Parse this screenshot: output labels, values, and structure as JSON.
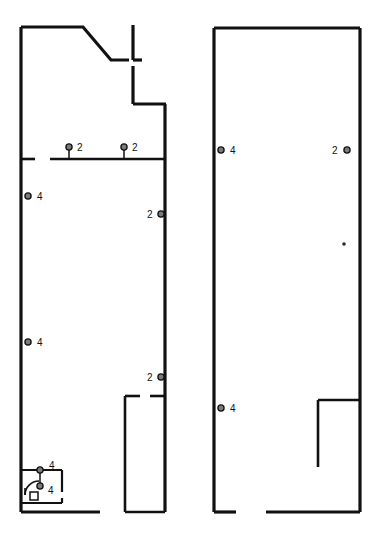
{
  "drawing": {
    "kind": "architectural-floor-plan",
    "title": "",
    "background_color": "#ffffff",
    "line_color": "#111111",
    "canvas": {
      "width": 372,
      "height": 546
    }
  },
  "units": [
    {
      "id": "left-unit",
      "name": "left-unit-outline",
      "description": "Left tenancy outline with chamfered top-right corner, stepped east wall and rear service room"
    },
    {
      "id": "right-unit",
      "name": "right-unit-outline",
      "description": "Right tenancy outline, rectangular with L-shaped rear partition"
    }
  ],
  "markers": [
    {
      "id": "m1",
      "label": "2",
      "unit": "left-unit",
      "element": "partition-wall",
      "style": "stem-up",
      "x": 69,
      "y": 158,
      "label_x": 77,
      "label_y": 151
    },
    {
      "id": "m2",
      "label": "2",
      "unit": "left-unit",
      "element": "partition-wall",
      "style": "stem-up",
      "x": 124,
      "y": 158,
      "label_x": 132,
      "label_y": 151
    },
    {
      "id": "m3",
      "label": "4",
      "unit": "left-unit",
      "element": "west-wall",
      "style": "ring",
      "x": 28,
      "y": 196,
      "label_x": 37,
      "label_y": 200
    },
    {
      "id": "m4",
      "label": "2",
      "unit": "left-unit",
      "element": "east-wall",
      "style": "ring",
      "x": 161,
      "y": 214,
      "label_x": 147,
      "label_y": 218
    },
    {
      "id": "m5",
      "label": "4",
      "unit": "left-unit",
      "element": "west-wall",
      "style": "ring",
      "x": 28,
      "y": 342,
      "label_x": 37,
      "label_y": 346
    },
    {
      "id": "m6",
      "label": "2",
      "unit": "left-unit",
      "element": "east-wall",
      "style": "ring",
      "x": 161,
      "y": 377,
      "label_x": 147,
      "label_y": 381
    },
    {
      "id": "m7",
      "label": "4",
      "unit": "left-unit",
      "element": "service-room",
      "style": "stem-down-top",
      "x": 40,
      "y": 470,
      "label_x": 49,
      "label_y": 469
    },
    {
      "id": "m8",
      "label": "4",
      "unit": "left-unit",
      "element": "service-room",
      "style": "ring",
      "x": 40,
      "y": 486,
      "label_x": 48,
      "label_y": 494
    },
    {
      "id": "m9",
      "label": "4",
      "unit": "right-unit",
      "element": "west-wall",
      "style": "ring",
      "x": 221,
      "y": 150,
      "label_x": 230,
      "label_y": 154
    },
    {
      "id": "m10",
      "label": "2",
      "unit": "right-unit",
      "element": "east-wall",
      "style": "ring",
      "x": 347,
      "y": 150,
      "label_x": 332,
      "label_y": 154
    },
    {
      "id": "m11",
      "label": "4",
      "unit": "right-unit",
      "element": "west-wall",
      "style": "ring",
      "x": 221,
      "y": 408,
      "label_x": 230,
      "label_y": 412
    }
  ],
  "fixtures": [
    {
      "id": "f1",
      "name": "door-swing-arc",
      "unit": "left-unit",
      "room": "service-room"
    },
    {
      "id": "f2",
      "name": "plumbing-fixture",
      "unit": "left-unit",
      "room": "service-room"
    },
    {
      "id": "f3",
      "name": "detail-speck",
      "unit": "right-unit",
      "x": 344,
      "y": 244
    }
  ],
  "geometry": {
    "left_unit": {
      "outline": "M21,27 L83,27 L111,60 L133,60 M133,60 L133,25 M133,76 L133,104 L165,104 L165,512 L100,512 L21,512 Z",
      "exterior_path_main": "M21,27 L83,27 L111,60 L133,60",
      "top_stub_vertical": "M133,25 L133,60",
      "notch_gap_vertical": "M133,76 L133,104",
      "step_horizontal": "M133,104 L165,104",
      "east_wall": "M165,104 L165,512",
      "bottom_wall": "M100,512 L21,512",
      "west_wall": "M21,27 L21,512",
      "partition_wall": "M50,159 L165,159",
      "west_wall_jamb": "M21,159 L35,159",
      "rear_room": "M125,396 L125,512 M165,396 L125,396 M125,512 L165,512",
      "service_room": "M21,470 L62,470 L62,503 L21,503"
    },
    "right_unit": {
      "outline": "M214,28 L360,28 L360,512 L277,512 M235,512 L214,512 L214,28",
      "rear_partition": "M318,400 L318,467 M318,400 L360,400"
    }
  }
}
